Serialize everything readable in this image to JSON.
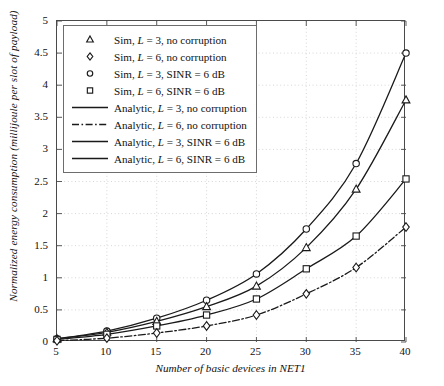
{
  "chart_data": {
    "type": "line",
    "title": "",
    "xlabel": "Number of basic devices in NET1",
    "ylabel": "Normalized energy consumption (millijoule per slot of payload)",
    "x": [
      5,
      10,
      15,
      20,
      25,
      30,
      35,
      40
    ],
    "xlim": [
      5,
      40
    ],
    "ylim": [
      0,
      5
    ],
    "xticks": [
      "5",
      "10",
      "15",
      "20",
      "25",
      "30",
      "35",
      "40"
    ],
    "yticks": [
      "0",
      "0.5",
      "1",
      "1.5",
      "2",
      "2.5",
      "3",
      "3.5",
      "4",
      "4.5",
      "5"
    ],
    "grid": true,
    "legend_position": "upper-left",
    "series": [
      {
        "name": "Sim, L = 3, SINR = 6 dB",
        "marker": "circle",
        "line": "solid",
        "values": [
          0.05,
          0.17,
          0.37,
          0.65,
          1.06,
          1.76,
          2.78,
          4.5
        ]
      },
      {
        "name": "Sim, L = 3, no corruption",
        "marker": "triangle",
        "line": "solid",
        "values": [
          0.05,
          0.15,
          0.32,
          0.55,
          0.87,
          1.47,
          2.38,
          3.77
        ]
      },
      {
        "name": "Sim, L = 6, SINR = 6 dB",
        "marker": "square",
        "line": "solid",
        "values": [
          0.04,
          0.12,
          0.25,
          0.42,
          0.67,
          1.14,
          1.65,
          2.54
        ]
      },
      {
        "name": "Sim, L = 6, no corruption",
        "marker": "diamond",
        "line": "dashdot",
        "values": [
          0.02,
          0.06,
          0.14,
          0.25,
          0.42,
          0.75,
          1.16,
          1.79
        ]
      }
    ]
  },
  "legend": {
    "items": [
      {
        "key": "marker-triangle",
        "label_plain": "Sim, L = 3, no corruption",
        "pre": "Sim, ",
        "var": "L",
        "post": " = 3, no corruption"
      },
      {
        "key": "marker-diamond",
        "label_plain": "Sim, L = 6, no corruption",
        "pre": "Sim, ",
        "var": "L",
        "post": " = 6, no corruption"
      },
      {
        "key": "marker-circle",
        "label_plain": "Sim, L = 3, SINR = 6 dB",
        "pre": "Sim, ",
        "var": "L",
        "post": " = 3, SINR = 6 dB"
      },
      {
        "key": "marker-square",
        "label_plain": "Sim, L = 6, SINR = 6 dB",
        "pre": "Sim, ",
        "var": "L",
        "post": " = 6, SINR = 6 dB"
      },
      {
        "key": "line-solid",
        "label_plain": "Analytic, L = 3, no corruption",
        "pre": "Analytic, ",
        "var": "L",
        "post": " = 3, no corruption"
      },
      {
        "key": "line-dashdot",
        "label_plain": "Analytic, L = 6, no corruption",
        "pre": "Analytic, ",
        "var": "L",
        "post": " = 6, no corruption"
      },
      {
        "key": "line-solid",
        "label_plain": "Analytic, L = 3, SINR = 6 dB",
        "pre": "Analytic, ",
        "var": "L",
        "post": " = 3, SINR = 6 dB"
      },
      {
        "key": "line-solid",
        "label_plain": "Analytic, L = 6, SINR = 6 dB",
        "pre": "Analytic, ",
        "var": "L",
        "post": " = 6, SINR = 6 dB"
      }
    ]
  },
  "colors": {
    "line": "#1a1a1a",
    "grid": "#cccccc",
    "frame": "#4a4a4a",
    "background": "#ffffff"
  }
}
